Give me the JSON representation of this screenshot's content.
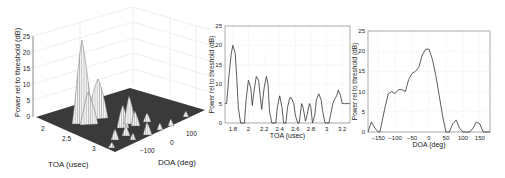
{
  "chart_data": [
    {
      "type": "surface3d",
      "title": "",
      "xlabel": "DOA (deg)",
      "ylabel": "TOA (usec)",
      "zlabel": "Power rel to threshold (dB)",
      "x_ticks": [
        "-100",
        "0",
        "100"
      ],
      "y_ticks": [
        "2",
        "2.5",
        "3"
      ],
      "z_ticks": [
        "0",
        "5",
        "10",
        "15",
        "20",
        "25"
      ],
      "zlim": [
        0,
        25
      ],
      "grid": true,
      "peaks": [
        {
          "toa": 1.8,
          "doa": -10,
          "power": 24
        },
        {
          "toa": 2.05,
          "doa": 15,
          "power": 12
        },
        {
          "toa": 2.2,
          "doa": -40,
          "power": 13
        },
        {
          "toa": 2.4,
          "doa": -60,
          "power": 7
        },
        {
          "toa": 2.6,
          "doa": 30,
          "power": 7
        },
        {
          "toa": 2.8,
          "doa": -30,
          "power": 5
        },
        {
          "toa": 2.95,
          "doa": 80,
          "power": 7
        },
        {
          "toa": 3.2,
          "doa": 130,
          "power": 4
        }
      ]
    },
    {
      "type": "line",
      "title": "",
      "xlabel": "TOA (usec)",
      "ylabel": "Power rel to threshold (dB)",
      "x_ticks": [
        "1.8",
        "2",
        "2.2",
        "2.4",
        "2.6",
        "2.8",
        "3",
        "3.2"
      ],
      "y_ticks": [
        "0",
        "5",
        "10",
        "15",
        "20",
        "25"
      ],
      "xlim": [
        1.7,
        3.3
      ],
      "ylim": [
        0,
        25
      ],
      "grid": true,
      "x": [
        1.7,
        1.72,
        1.75,
        1.78,
        1.8,
        1.83,
        1.85,
        1.87,
        1.9,
        1.93,
        1.95,
        1.97,
        2.0,
        2.03,
        2.05,
        2.07,
        2.1,
        2.13,
        2.15,
        2.17,
        2.2,
        2.23,
        2.25,
        2.27,
        2.3,
        2.33,
        2.35,
        2.37,
        2.4,
        2.43,
        2.45,
        2.48,
        2.5,
        2.53,
        2.55,
        2.58,
        2.6,
        2.63,
        2.65,
        2.68,
        2.7,
        2.73,
        2.75,
        2.78,
        2.8,
        2.82,
        2.85,
        2.87,
        2.9,
        2.93,
        2.95,
        2.98,
        3.0,
        3.03,
        3.05,
        3.08,
        3.1,
        3.13,
        3.15,
        3.18,
        3.2,
        3.23,
        3.25,
        3.28,
        3.3
      ],
      "values": [
        5,
        5,
        12,
        18,
        20,
        18,
        12,
        4,
        0,
        0,
        0,
        6,
        11,
        9,
        4.5,
        8,
        12,
        11,
        7,
        3.5,
        9,
        12,
        10,
        3,
        0,
        0,
        0,
        4,
        7,
        4,
        0,
        0,
        4,
        6.5,
        6.5,
        5,
        2,
        0,
        0,
        5,
        4,
        0.5,
        2,
        5,
        4,
        0,
        2,
        6,
        7.5,
        6,
        3,
        0,
        0,
        0,
        2,
        5,
        6,
        7,
        8.5,
        7,
        5,
        5,
        5,
        5,
        5
      ]
    },
    {
      "type": "line",
      "title": "",
      "xlabel": "DOA (deg)",
      "ylabel": "Power rel to threshold (dB)",
      "x_ticks": [
        "-150",
        "-100",
        "-50",
        "0",
        "50",
        "100",
        "150"
      ],
      "y_ticks": [
        "0",
        "5",
        "10",
        "15",
        "20",
        "25"
      ],
      "xlim": [
        -180,
        180
      ],
      "ylim": [
        0,
        25
      ],
      "grid": true,
      "x": [
        -180,
        -170,
        -160,
        -150,
        -145,
        -140,
        -130,
        -120,
        -110,
        -100,
        -90,
        -80,
        -70,
        -60,
        -50,
        -40,
        -30,
        -20,
        -10,
        0,
        10,
        20,
        30,
        40,
        50,
        55,
        60,
        70,
        80,
        90,
        100,
        110,
        120,
        130,
        140,
        150,
        160,
        170,
        180
      ],
      "values": [
        0,
        2.5,
        1,
        0,
        0,
        2,
        6,
        9.5,
        10,
        9.5,
        10.5,
        10.5,
        10,
        13,
        14.5,
        15,
        16,
        19,
        20.5,
        20.5,
        18,
        14,
        9,
        4,
        0,
        0,
        0,
        2,
        3,
        1,
        0,
        0,
        0,
        1,
        2.5,
        2,
        0,
        0,
        0
      ]
    }
  ]
}
